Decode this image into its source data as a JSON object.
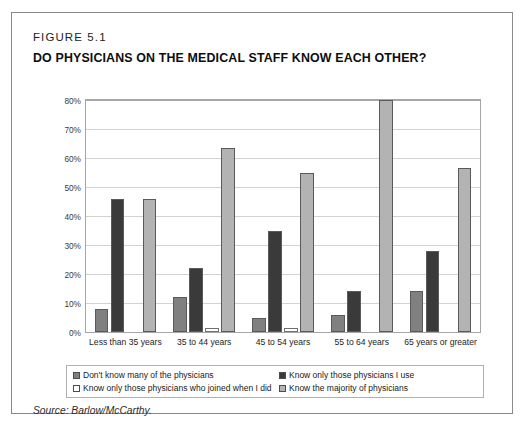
{
  "figure": {
    "number": "FIGURE 5.1",
    "title": "DO PHYSICIANS ON THE MEDICAL STAFF KNOW EACH OTHER?",
    "source": "Source: Barlow/McCarthy."
  },
  "colors": {
    "series_1": "#808080",
    "series_2": "#3a3a3a",
    "series_3": "#ffffff",
    "series_4": "#b3b3b3",
    "frame_border": "#8a8a8a",
    "plot_border": "#a6a6a6",
    "gridline": "#d2d2d2",
    "text": "#1a1a1a"
  },
  "chart_data": {
    "type": "bar",
    "title": "DO PHYSICIANS ON THE MEDICAL STAFF KNOW EACH OTHER?",
    "xlabel": "",
    "ylabel": "",
    "ylim": [
      0,
      80
    ],
    "ytick_labels": [
      "80%",
      "70%",
      "60%",
      "50%",
      "40%",
      "30%",
      "20%",
      "10%",
      "0%"
    ],
    "ytick_values": [
      80,
      70,
      60,
      50,
      40,
      30,
      20,
      10,
      0
    ],
    "grid": true,
    "legend_position": "bottom",
    "categories": [
      "Less than 35 years",
      "35 to 44 years",
      "45 to 54 years",
      "55 to 64 years",
      "65 years or greater"
    ],
    "series": [
      {
        "name": "Don't know many of the physicians",
        "color": "#808080",
        "values": [
          8,
          12,
          5,
          6,
          14
        ]
      },
      {
        "name": "Know only those physicians I use",
        "color": "#3a3a3a",
        "values": [
          46,
          22,
          35,
          14,
          28
        ]
      },
      {
        "name": "Know only those physicians who joined when I did",
        "color": "#ffffff",
        "values": [
          0,
          1.3,
          1.5,
          0,
          0
        ]
      },
      {
        "name": "Know the majority of physicians",
        "color": "#b3b3b3",
        "values": [
          46,
          63.5,
          55,
          80,
          56.5
        ]
      }
    ]
  },
  "legend": {
    "entries": [
      {
        "label": "Don't know many of the physicians",
        "color": "#808080"
      },
      {
        "label": "Know only those physicians I use",
        "color": "#3a3a3a"
      },
      {
        "label": "Know only those physicians who joined when I did",
        "color": "#ffffff"
      },
      {
        "label": "Know the majority of physicians",
        "color": "#b3b3b3"
      }
    ]
  }
}
